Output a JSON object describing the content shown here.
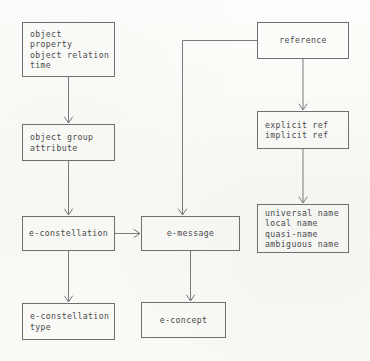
{
  "diagram": {
    "style": {
      "page_background": "#fbfbf9",
      "box_border_color": "#6f6f72",
      "text_color": "#4a4a4d",
      "connector_color": "#6b6b6e"
    },
    "nodes": [
      {
        "id": "object-properties",
        "name": "object-properties-box",
        "lines": [
          "object",
          "property",
          "object relation",
          "time"
        ],
        "align": "left",
        "x": 22,
        "y": 22,
        "w": 93,
        "h": 55
      },
      {
        "id": "object-group",
        "name": "object-group-attribute-box",
        "lines": [
          "object group",
          "attribute"
        ],
        "align": "left",
        "x": 22,
        "y": 124,
        "w": 93,
        "h": 37
      },
      {
        "id": "e-constellation",
        "name": "e-constellation-box",
        "lines": [
          "e-constellation"
        ],
        "align": "center",
        "x": 22,
        "y": 216,
        "w": 93,
        "h": 35
      },
      {
        "id": "e-constellation-type",
        "name": "e-constellation-type-box",
        "lines": [
          "e-constellation",
          "type"
        ],
        "align": "left",
        "x": 22,
        "y": 303,
        "w": 93,
        "h": 37
      },
      {
        "id": "e-message",
        "name": "e-message-box",
        "lines": [
          "e-message"
        ],
        "align": "center",
        "x": 141,
        "y": 216,
        "w": 99,
        "h": 35
      },
      {
        "id": "e-concept",
        "name": "e-concept-box",
        "lines": [
          "e-concept"
        ],
        "align": "center",
        "x": 141,
        "y": 302,
        "w": 85,
        "h": 36
      },
      {
        "id": "reference",
        "name": "reference-box",
        "lines": [
          "reference"
        ],
        "align": "center",
        "x": 257,
        "y": 22,
        "w": 92,
        "h": 37
      },
      {
        "id": "ref-kinds",
        "name": "explicit-implicit-ref-box",
        "lines": [
          "explicit ref",
          "implicit ref"
        ],
        "align": "left",
        "x": 257,
        "y": 111,
        "w": 92,
        "h": 38
      },
      {
        "id": "name-kinds",
        "name": "name-kinds-box",
        "lines": [
          "universal name",
          "local name",
          "quasi-name",
          "ambiguous name"
        ],
        "align": "left",
        "x": 257,
        "y": 204,
        "w": 92,
        "h": 49
      }
    ],
    "connectors": [
      {
        "id": "c1",
        "name": "connector-object-properties-to-object-group",
        "from": "object-properties",
        "to": "object-group",
        "path": "M 68.5 77 L 68.5 122",
        "arrow": "down",
        "arrow_at": [
          68.5,
          123
        ]
      },
      {
        "id": "c2",
        "name": "connector-object-group-to-e-constellation",
        "from": "object-group",
        "to": "e-constellation",
        "path": "M 68.5 161 L 68.5 214",
        "arrow": "down",
        "arrow_at": [
          68.5,
          215
        ]
      },
      {
        "id": "c3",
        "name": "connector-e-constellation-to-e-constellation-type",
        "from": "e-constellation",
        "to": "e-constellation-type",
        "path": "M 68.5 251 L 68.5 301",
        "arrow": "down",
        "arrow_at": [
          68.5,
          302
        ]
      },
      {
        "id": "c4",
        "name": "connector-e-constellation-to-e-message",
        "from": "e-constellation",
        "to": "e-message",
        "path": "M 115 233.5 L 139 233.5",
        "arrow": "right",
        "arrow_at": [
          140,
          233.5
        ]
      },
      {
        "id": "c5",
        "name": "connector-e-message-to-e-concept",
        "from": "e-message",
        "to": "e-concept",
        "path": "M 190.5 251 L 190.5 300",
        "arrow": "down",
        "arrow_at": [
          190.5,
          301
        ]
      },
      {
        "id": "c6",
        "name": "connector-reference-to-e-message",
        "from": "reference",
        "to": "e-message",
        "path": "M 257 40.5 L 182.5 40.5 L 182.5 214",
        "arrow": "down",
        "arrow_at": [
          182.5,
          215
        ]
      },
      {
        "id": "c7",
        "name": "connector-reference-to-ref-kinds",
        "from": "reference",
        "to": "ref-kinds",
        "path": "M 303 59 L 303 109",
        "arrow": "down",
        "arrow_at": [
          303,
          110
        ]
      },
      {
        "id": "c8",
        "name": "connector-ref-kinds-to-name-kinds",
        "from": "ref-kinds",
        "to": "name-kinds",
        "path": "M 303 149 L 303 202",
        "arrow": "down",
        "arrow_at": [
          303,
          203
        ]
      }
    ]
  }
}
